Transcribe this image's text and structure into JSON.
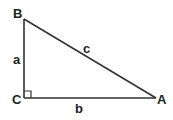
{
  "diagram": {
    "vertices": [
      {
        "label": "B",
        "x": 24,
        "y": 19
      },
      {
        "label": "C",
        "x": 24,
        "y": 98
      },
      {
        "label": "A",
        "x": 156,
        "y": 98
      }
    ],
    "sides": [
      {
        "label": "a",
        "from": "B",
        "to": "C"
      },
      {
        "label": "b",
        "from": "C",
        "to": "A"
      },
      {
        "label": "c",
        "from": "B",
        "to": "A"
      }
    ],
    "right_angle_at": "C",
    "labels": {
      "B": "B",
      "C": "C",
      "A": "A",
      "a": "a",
      "b": "b",
      "c": "c"
    },
    "colors": {
      "stroke": "#333333",
      "text": "#222222",
      "background": "#ffffff"
    }
  }
}
